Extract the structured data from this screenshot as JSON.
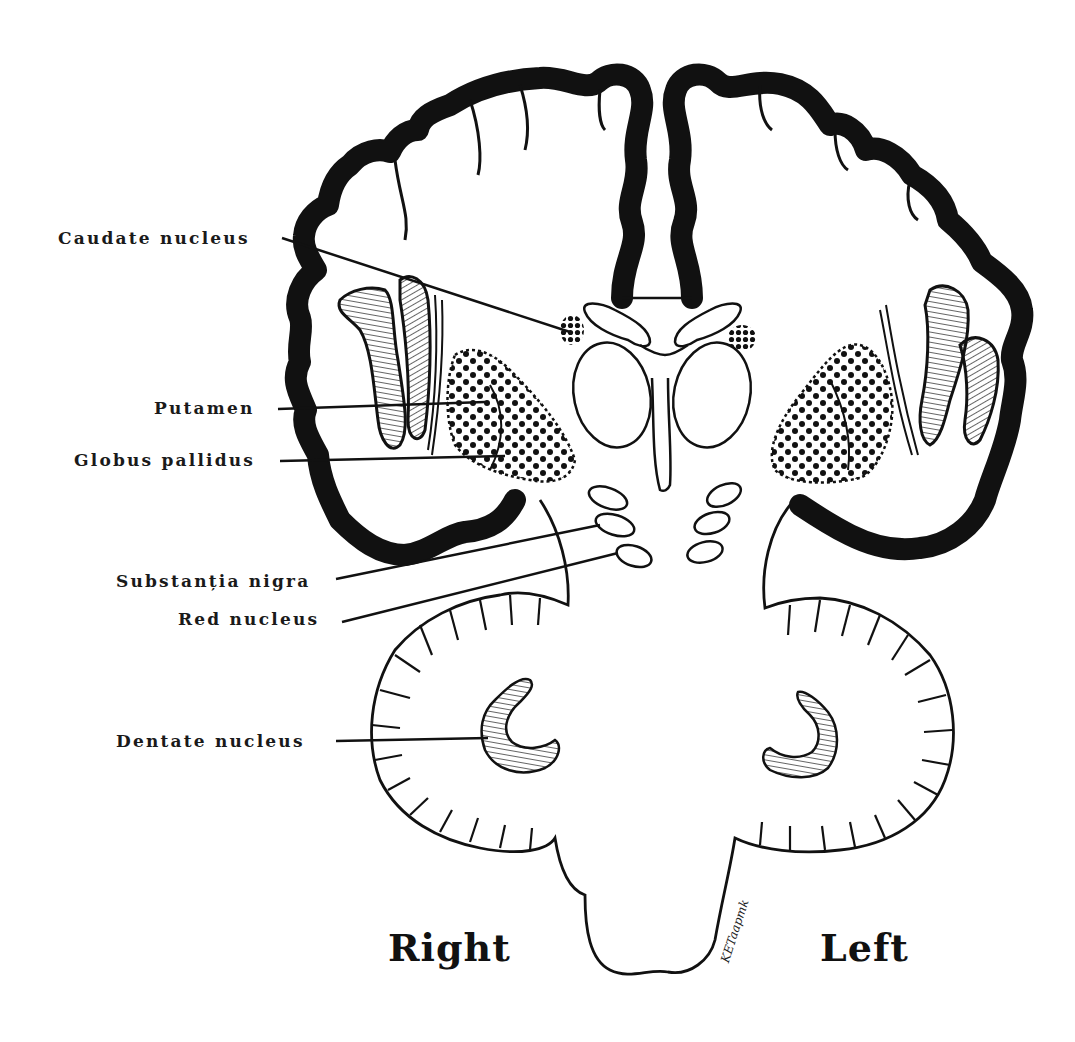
{
  "figure": {
    "labels": [
      {
        "id": "caudate",
        "text": "Caudate nucleus"
      },
      {
        "id": "putamen",
        "text": "Putamen"
      },
      {
        "id": "globus",
        "text": "Globus pallidus"
      },
      {
        "id": "substantia",
        "text": "Substanția nigra"
      },
      {
        "id": "red",
        "text": "Red nucleus"
      },
      {
        "id": "dentate",
        "text": "Dentate nucleus"
      }
    ],
    "sides": {
      "right": "Right",
      "left": "Left"
    },
    "signature": "KETaapmk"
  },
  "colors": {
    "ink": "#111111",
    "background": "#ffffff"
  }
}
